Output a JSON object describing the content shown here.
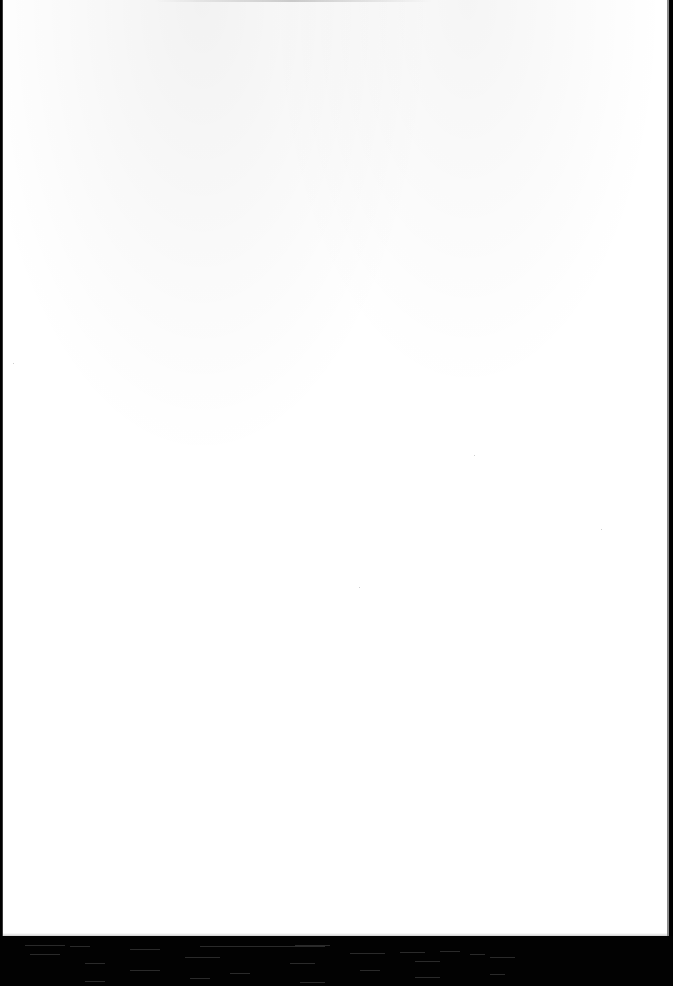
{
  "document": {
    "type": "scanned-page",
    "content": "",
    "page_color": "#ffffff",
    "scanner_bed_color": "#020202"
  },
  "streaks": [
    {
      "x": 25,
      "y": 9,
      "w": 40
    },
    {
      "x": 70,
      "y": 10,
      "w": 20
    },
    {
      "x": 200,
      "y": 10,
      "w": 125
    },
    {
      "x": 295,
      "y": 9,
      "w": 35
    },
    {
      "x": 130,
      "y": 13,
      "w": 30
    },
    {
      "x": 30,
      "y": 18,
      "w": 30
    },
    {
      "x": 185,
      "y": 21,
      "w": 35
    },
    {
      "x": 350,
      "y": 17,
      "w": 35
    },
    {
      "x": 400,
      "y": 16,
      "w": 25
    },
    {
      "x": 440,
      "y": 15,
      "w": 20
    },
    {
      "x": 470,
      "y": 18,
      "w": 15
    },
    {
      "x": 490,
      "y": 21,
      "w": 25
    },
    {
      "x": 85,
      "y": 27,
      "w": 20
    },
    {
      "x": 290,
      "y": 27,
      "w": 25
    },
    {
      "x": 415,
      "y": 25,
      "w": 25
    },
    {
      "x": 130,
      "y": 34,
      "w": 30
    },
    {
      "x": 360,
      "y": 34,
      "w": 20
    },
    {
      "x": 230,
      "y": 37,
      "w": 20
    },
    {
      "x": 190,
      "y": 42,
      "w": 20
    },
    {
      "x": 300,
      "y": 46,
      "w": 25
    },
    {
      "x": 415,
      "y": 41,
      "w": 25
    },
    {
      "x": 490,
      "y": 38,
      "w": 15
    },
    {
      "x": 85,
      "y": 45,
      "w": 20
    }
  ]
}
